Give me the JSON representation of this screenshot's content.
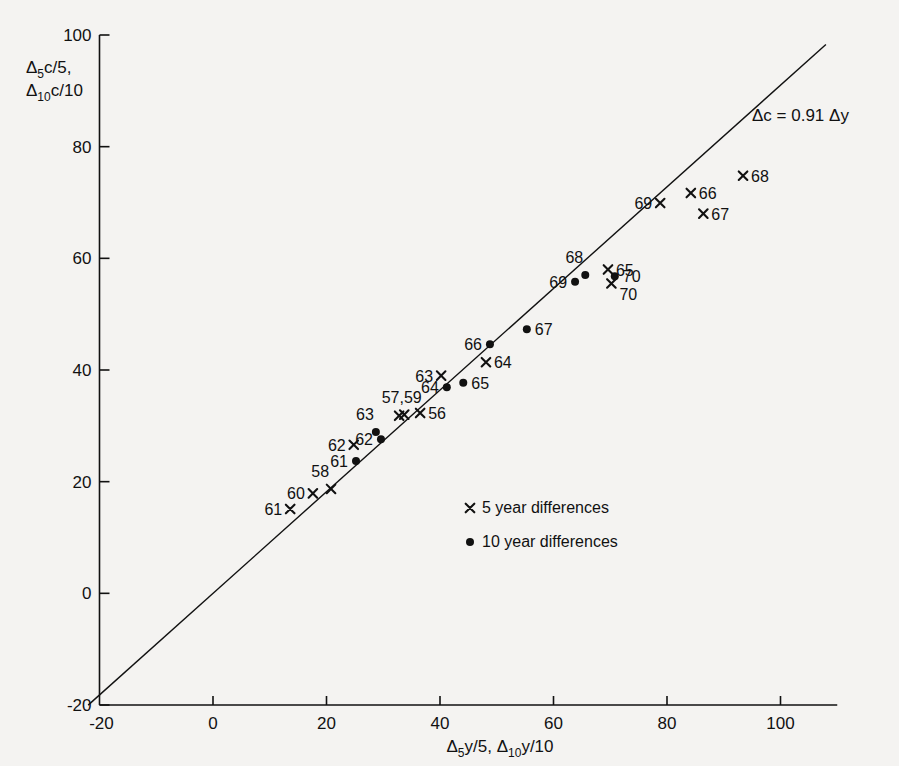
{
  "chart_data": {
    "type": "scatter",
    "title": "",
    "xlabel": "Δ5y/5, Δ10y/10",
    "ylabel": "Δ5c/5, Δ10c/10",
    "xlim": [
      -20,
      110
    ],
    "ylim": [
      -20,
      100
    ],
    "xticks": [
      -20,
      0,
      20,
      40,
      60,
      80,
      100
    ],
    "yticks": [
      -20,
      0,
      20,
      40,
      60,
      80,
      100
    ],
    "grid": false,
    "legend_position": "center",
    "annotation": "Δc = 0.91 Δy",
    "fit_line": {
      "slope": 0.91,
      "intercept": 0,
      "label": "Δc = 0.91 Δy"
    },
    "series": [
      {
        "name": "5 year differences",
        "marker": "x",
        "points": [
          {
            "label": "61",
            "x": 13.6,
            "y": 15.1,
            "label_side": "left"
          },
          {
            "label": "60",
            "x": 17.6,
            "y": 17.9,
            "label_side": "left"
          },
          {
            "label": "58",
            "x": 20.8,
            "y": 18.7,
            "label_side": "above-left"
          },
          {
            "label": "62",
            "x": 24.8,
            "y": 26.6,
            "label_side": "left"
          },
          {
            "label": "57",
            "x": 32.8,
            "y": 31.8,
            "label_side": "above"
          },
          {
            "label": "59",
            "x": 33.7,
            "y": 32.0,
            "label_side": "above"
          },
          {
            "label": "56",
            "x": 36.5,
            "y": 32.3,
            "label_side": "right"
          },
          {
            "label": "63",
            "x": 40.2,
            "y": 39.0,
            "label_side": "left"
          },
          {
            "label": "64",
            "x": 48.1,
            "y": 41.4,
            "label_side": "right"
          },
          {
            "label": "65",
            "x": 69.6,
            "y": 58.0,
            "label_side": "right"
          },
          {
            "label": "70",
            "x": 70.2,
            "y": 55.5,
            "label_side": "below-right"
          },
          {
            "label": "69",
            "x": 78.8,
            "y": 69.9,
            "label_side": "left"
          },
          {
            "label": "66",
            "x": 84.2,
            "y": 71.7,
            "label_side": "right"
          },
          {
            "label": "67",
            "x": 86.4,
            "y": 68.0,
            "label_side": "right"
          },
          {
            "label": "68",
            "x": 93.4,
            "y": 74.8,
            "label_side": "right"
          }
        ]
      },
      {
        "name": "10 year differences",
        "marker": "dot",
        "points": [
          {
            "label": "61",
            "x": 25.2,
            "y": 23.7,
            "label_side": "left"
          },
          {
            "label": "62",
            "x": 29.6,
            "y": 27.6,
            "label_side": "left"
          },
          {
            "label": "63",
            "x": 28.7,
            "y": 28.9,
            "label_side": "above-left"
          },
          {
            "label": "64",
            "x": 41.2,
            "y": 36.9,
            "label_side": "left"
          },
          {
            "label": "65",
            "x": 44.1,
            "y": 37.7,
            "label_side": "right"
          },
          {
            "label": "66",
            "x": 48.8,
            "y": 44.6,
            "label_side": "left"
          },
          {
            "label": "67",
            "x": 55.3,
            "y": 47.3,
            "label_side": "right"
          },
          {
            "label": "69",
            "x": 63.8,
            "y": 55.8,
            "label_side": "left"
          },
          {
            "label": "68",
            "x": 65.6,
            "y": 57.0,
            "label_side": "above-left"
          },
          {
            "label": "70",
            "x": 70.8,
            "y": 56.8,
            "label_side": "right"
          }
        ]
      }
    ],
    "legend": [
      {
        "marker": "x",
        "label": "5 year differences"
      },
      {
        "marker": "dot",
        "label": "10 year differences"
      }
    ]
  },
  "axis": {
    "y_title_line1_base": "Δ",
    "y_title_line1_sub": "5",
    "y_title_line1_rest": "c/5,",
    "y_title_line2_base": "Δ",
    "y_title_line2_sub": "10",
    "y_title_line2_rest": "c/10",
    "x_title_base1": "Δ",
    "x_title_sub1": "5",
    "x_title_rest1": "y/5, ",
    "x_title_base2": "Δ",
    "x_title_sub2": "10",
    "x_title_rest2": "y/10"
  },
  "colors": {
    "background": "#f4f3f1",
    "ink": "#111111",
    "axis": "#111111"
  }
}
